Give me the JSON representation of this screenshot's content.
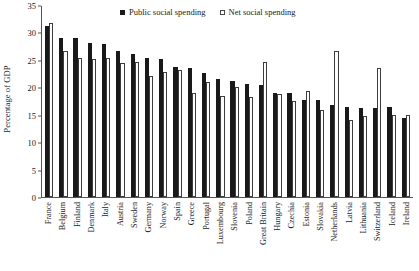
{
  "chart_data": {
    "type": "bar",
    "title": "",
    "xlabel": "",
    "ylabel": "Percentage of GDP",
    "ylim": [
      0,
      35
    ],
    "yticks": [
      0,
      5,
      10,
      15,
      20,
      25,
      30,
      35
    ],
    "grid": false,
    "legend_position": "top-center",
    "categories": [
      "France",
      "Belgium",
      "Finland",
      "Denmark",
      "Italy",
      "Austria",
      "Sweden",
      "Germany",
      "Norway",
      "Spain",
      "Greece",
      "Portugal",
      "Luxembourg",
      "Slovenia",
      "Poland",
      "Great Britain",
      "Hungary",
      "Czechia",
      "Estonia",
      "Slovakia",
      "Netherlands",
      "Latvia",
      "Lithuania",
      "Switzerland",
      "Iceland",
      "Ireland"
    ],
    "series": [
      {
        "name": "Public social spending",
        "color": "#191919",
        "values": [
          31.2,
          28.9,
          28.9,
          28.0,
          27.9,
          26.7,
          26.1,
          25.3,
          25.1,
          23.7,
          23.5,
          22.6,
          21.6,
          21.2,
          20.6,
          20.5,
          19.0,
          19.0,
          17.7,
          17.6,
          16.7,
          16.4,
          16.2,
          16.3,
          16.4,
          14.4
        ]
      },
      {
        "name": "Net social spending",
        "color": "#fdfdfd",
        "values": [
          31.7,
          26.6,
          25.3,
          25.2,
          25.3,
          24.4,
          24.7,
          22.1,
          22.7,
          23.1,
          18.9,
          21.0,
          18.5,
          20.0,
          18.3,
          24.7,
          18.8,
          17.5,
          19.3,
          15.8,
          26.6,
          14.0,
          14.7,
          23.6,
          14.9,
          15.0
        ]
      }
    ]
  },
  "legend": {
    "entries": [
      {
        "label": "Public social spending",
        "marker": "filled-square"
      },
      {
        "label": "Net social spending",
        "marker": "open-square"
      }
    ]
  },
  "axes": {
    "y_title": "Percentage of GDP",
    "y_tick_labels": [
      "35",
      "30",
      "25",
      "20",
      "15",
      "10",
      "5",
      "0"
    ]
  },
  "colors": {
    "public": "#191919",
    "net": "#ffffff",
    "net_outline": "#3d3d3d",
    "axis": "#555555",
    "text": "#1a1a1a",
    "background": "#ffffff"
  }
}
